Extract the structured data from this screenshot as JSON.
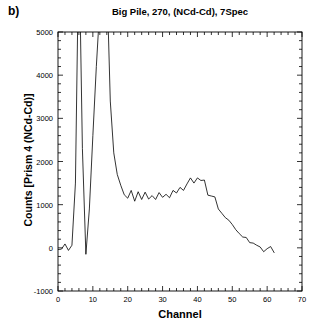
{
  "panel": {
    "label": "b)"
  },
  "chart_data": {
    "type": "line",
    "title": "Big Pile, 270, (NCd-Cd), 7Spec",
    "xlabel": "Channel",
    "ylabel": "Counts [Prism 4 (NCd-Cd)]",
    "xlim": [
      0,
      70
    ],
    "ylim": [
      -1000,
      5000
    ],
    "xticks": [
      0,
      10,
      20,
      30,
      40,
      50,
      60,
      70
    ],
    "xtick_labels": [
      "0",
      "10",
      "20",
      "30",
      "40",
      "50",
      "60",
      "70"
    ],
    "x_minor_step": 2,
    "yticks": [
      -1000,
      0,
      1000,
      2000,
      3000,
      4000,
      5000
    ],
    "ytick_labels": [
      "-1000",
      "0",
      "1000",
      "2000",
      "3000",
      "4000",
      "5000"
    ],
    "y_minor_step": 200,
    "grid": false,
    "legend": null,
    "line_color": "#000000",
    "series": [
      {
        "name": "Counts [Prism 4 (NCd-Cd)]",
        "x": [
          0,
          1,
          2,
          3,
          4,
          5,
          6,
          7,
          8,
          9,
          10,
          11,
          12,
          13,
          14,
          15,
          16,
          17,
          18,
          19,
          20,
          21,
          22,
          23,
          24,
          25,
          26,
          27,
          28,
          29,
          30,
          31,
          32,
          33,
          34,
          35,
          36,
          37,
          38,
          39,
          40,
          41,
          42,
          43,
          44,
          45,
          46,
          47,
          48,
          49,
          50,
          51,
          52,
          53,
          54,
          55,
          56,
          57,
          58,
          59,
          60,
          61,
          62
        ],
        "values": [
          -40,
          -30,
          90,
          -60,
          60,
          1500,
          7200,
          2300,
          -150,
          900,
          2600,
          4200,
          5600,
          7400,
          6300,
          3400,
          2200,
          1700,
          1450,
          1230,
          1150,
          1330,
          1080,
          1300,
          1120,
          1290,
          1130,
          1210,
          1120,
          1280,
          1170,
          1240,
          1160,
          1330,
          1270,
          1400,
          1330,
          1480,
          1620,
          1500,
          1620,
          1560,
          1570,
          1220,
          1200,
          1180,
          900,
          800,
          700,
          640,
          540,
          420,
          330,
          250,
          240,
          120,
          110,
          60,
          20,
          -90,
          -20,
          30,
          -110
        ]
      }
    ]
  }
}
